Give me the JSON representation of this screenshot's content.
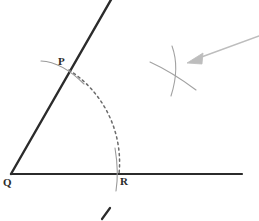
{
  "figure": {
    "background_color": "#ffffff",
    "labels": {
      "P": "P",
      "Q": "Q",
      "R": "R"
    },
    "colors": {
      "ray_stroke": "#2b2b2b",
      "arc_stroke": "#8f8f8f",
      "dashed_arc_stroke": "#6b6b6b",
      "arrow_stroke": "#b9b9b9",
      "label_text": "#2b2b2b",
      "tick_stroke": "#2b2b2b"
    },
    "geometry": {
      "vertex_Q": {
        "x": 11,
        "y": 174
      },
      "point_P": {
        "x": 68,
        "y": 68
      },
      "point_R": {
        "x": 117,
        "y": 174
      },
      "horizontal_ray_end": {
        "x": 242,
        "y": 174
      },
      "slanted_ray_end": {
        "x": 112,
        "y": 0
      },
      "arc_radius": 110,
      "intersection_marks": {
        "x": 175,
        "y": 68
      },
      "arrow_tail": {
        "x": 259,
        "y": 36
      },
      "arrow_head": {
        "x": 189,
        "y": 62
      }
    },
    "elements": {
      "slanted_ray_name": "ray-QP",
      "horizontal_ray_name": "ray-QR",
      "dashed_arc_name": "dashed-arc-PR",
      "arc_at_P_name": "arc-mark-at-P",
      "arc_at_R_name": "arc-mark-at-R",
      "crossing_arcs_name": "crossing-arc-marks",
      "pointer_name": "pointer-arrow",
      "bottom_tick_name": "bottom-tick-mark"
    }
  }
}
